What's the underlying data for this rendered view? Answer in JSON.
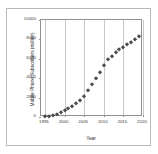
{
  "chart_data": {
    "type": "scatter",
    "title": "",
    "xlabel": "Year",
    "ylabel": "Mobile Phone Subscribers  (million)",
    "xlim": [
      1994,
      2020
    ],
    "ylim": [
      0,
      10000
    ],
    "xticks": [
      "1995",
      "2000",
      "2005",
      "2010",
      "2015",
      "2020"
    ],
    "xtick_values": [
      1995,
      2000,
      2005,
      2010,
      2015,
      2020
    ],
    "yticks": [
      "0",
      "2000",
      "4000",
      "6000",
      "8000",
      "10000"
    ],
    "ytick_values": [
      0,
      2000,
      4000,
      6000,
      8000,
      10000
    ],
    "grid": "vertical",
    "legend": "none",
    "marker_color": "#4d4d4d",
    "marker_shape": "diamond",
    "x": [
      1995,
      1996,
      1997,
      1998,
      1999,
      2000,
      2001,
      2002,
      2003,
      2004,
      2005,
      2006,
      2007,
      2008,
      2009,
      2010,
      2011,
      2012,
      2013,
      2014,
      2015,
      2016,
      2017,
      2018,
      2019
    ],
    "y": [
      91,
      145,
      215,
      318,
      490,
      740,
      960,
      1160,
      1420,
      1760,
      2210,
      2760,
      3370,
      4030,
      4640,
      5320,
      5950,
      6310,
      6680,
      6990,
      7180,
      7500,
      7750,
      8030,
      8400
    ],
    "series": [
      {
        "name": "Mobile phone subscribers",
        "values": [
          91,
          145,
          215,
          318,
          490,
          740,
          960,
          1160,
          1420,
          1760,
          2210,
          2760,
          3370,
          4030,
          4640,
          5320,
          5950,
          6310,
          6680,
          6990,
          7180,
          7500,
          7750,
          8030,
          8400
        ]
      }
    ]
  }
}
